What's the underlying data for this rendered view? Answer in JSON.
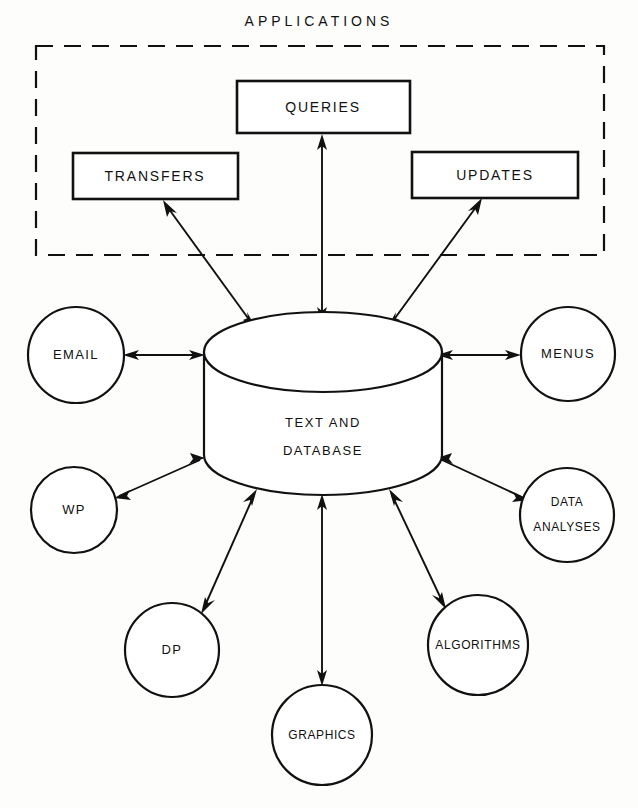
{
  "diagram": {
    "title": "APPLICATIONS",
    "group_title": "APPLICATIONS",
    "center_node": {
      "name": "text-and-database",
      "line1": "TEXT AND",
      "line2": "DATABASE",
      "shape": "cylinder"
    },
    "application_boxes": [
      {
        "id": "queries",
        "label": "QUERIES",
        "shape": "rectangle"
      },
      {
        "id": "transfers",
        "label": "TRANSFERS",
        "shape": "rectangle"
      },
      {
        "id": "updates",
        "label": "UPDATES",
        "shape": "rectangle"
      }
    ],
    "circle_nodes": [
      {
        "id": "email",
        "label": "EMAIL",
        "shape": "circle"
      },
      {
        "id": "menus",
        "label": "MENUS",
        "shape": "circle"
      },
      {
        "id": "wp",
        "label": "WP",
        "shape": "circle"
      },
      {
        "id": "data-analyses",
        "label_line1": "DATA",
        "label_line2": "ANALYSES",
        "shape": "circle"
      },
      {
        "id": "dp",
        "label": "DP",
        "shape": "circle"
      },
      {
        "id": "algorithms",
        "label": "ALGORITHMS",
        "shape": "circle"
      },
      {
        "id": "graphics",
        "label": "GRAPHICS",
        "shape": "circle"
      }
    ],
    "connections": [
      {
        "from": "text-and-database",
        "to": "queries",
        "arrows": "both"
      },
      {
        "from": "text-and-database",
        "to": "transfers",
        "arrows": "both"
      },
      {
        "from": "text-and-database",
        "to": "updates",
        "arrows": "both"
      },
      {
        "from": "text-and-database",
        "to": "email",
        "arrows": "both"
      },
      {
        "from": "text-and-database",
        "to": "menus",
        "arrows": "both"
      },
      {
        "from": "text-and-database",
        "to": "wp",
        "arrows": "both"
      },
      {
        "from": "text-and-database",
        "to": "data-analyses",
        "arrows": "both"
      },
      {
        "from": "text-and-database",
        "to": "dp",
        "arrows": "both"
      },
      {
        "from": "text-and-database",
        "to": "algorithms",
        "arrows": "both"
      },
      {
        "from": "text-and-database",
        "to": "graphics",
        "arrows": "both"
      }
    ],
    "colors": {
      "stroke": "#111111",
      "fill": "#ffffff",
      "background": "#fdfdfb"
    }
  }
}
